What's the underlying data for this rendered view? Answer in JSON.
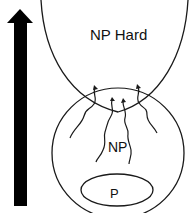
{
  "diagram": {
    "labels": {
      "np_hard": "NP Hard",
      "np": "NP",
      "p": "P"
    },
    "arrow": {
      "direction": "up",
      "color": "#000000"
    },
    "line_color": "#1a1a1a"
  }
}
